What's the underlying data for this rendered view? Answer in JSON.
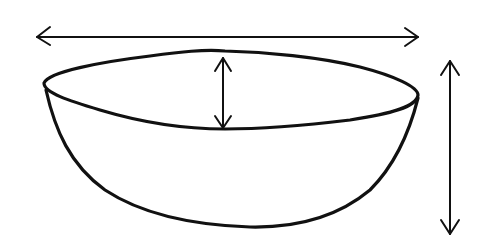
{
  "diagram": {
    "style": "hand-drawn sketch",
    "colors": {
      "background": "#ffffff",
      "ink": "#111111"
    },
    "dimensions": [
      {
        "id": "width",
        "orientation": "horizontal",
        "meaning": "overall width of bowl rim",
        "label": ""
      },
      {
        "id": "rim-depth",
        "orientation": "vertical",
        "meaning": "depth of rim opening (front-to-back in perspective)",
        "label": ""
      },
      {
        "id": "height",
        "orientation": "vertical",
        "meaning": "overall height of bowl",
        "label": ""
      }
    ]
  }
}
